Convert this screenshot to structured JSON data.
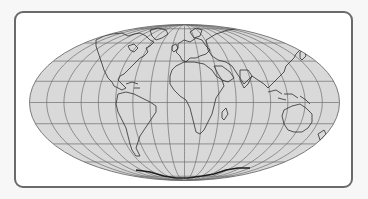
{
  "map": {
    "projection": "mollweide",
    "center": {
      "cx": 184.5,
      "cy": 102.5
    },
    "radii": {
      "rx": 155,
      "ry": 78
    },
    "graticule": {
      "meridian_step_deg": 20,
      "parallel_step_deg": 20
    },
    "colors": {
      "page_background": "#f7f7f7",
      "frame_border": "#6a6a6a",
      "frame_fill": "#ffffff",
      "ocean_fill": "#d9d9d9",
      "graticule": "#6f6f6f",
      "coastline": "#2e2e2e"
    },
    "features": [
      "graticule",
      "coastlines",
      "antarctica"
    ]
  }
}
